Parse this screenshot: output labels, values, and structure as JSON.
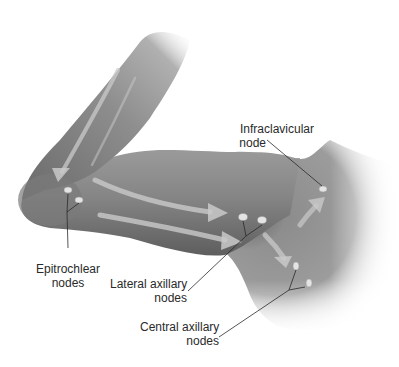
{
  "figure": {
    "type": "anatomical-illustration",
    "colors": {
      "background": "#ffffff",
      "skin_dark": "#6e6e6e",
      "skin_mid": "#8c8c8c",
      "skin_light": "#b4b4b4",
      "arrow": "#c8c8c8",
      "node": "#e2e2e2",
      "leader_line": "#2a2a2a",
      "label_text": "#2a2a2a"
    }
  },
  "labels": {
    "infraclavicular": {
      "line1": "Infraclavicular",
      "line2": "node"
    },
    "epitrochlear": {
      "line1": "Epitrochlear",
      "line2": "nodes"
    },
    "lateral_axillary": {
      "line1": "Lateral axillary",
      "line2": "nodes"
    },
    "central_axillary": {
      "line1": "Central axillary",
      "line2": "nodes"
    }
  },
  "nodes": [
    {
      "name": "epitrochlear-node-1",
      "x": 68,
      "y": 190
    },
    {
      "name": "epitrochlear-node-2",
      "x": 79,
      "y": 200
    },
    {
      "name": "lateral-axillary-node-1",
      "x": 243,
      "y": 217
    },
    {
      "name": "lateral-axillary-node-2",
      "x": 262,
      "y": 222
    },
    {
      "name": "central-axillary-node-1",
      "x": 296,
      "y": 267
    },
    {
      "name": "central-axillary-node-2",
      "x": 309,
      "y": 283
    },
    {
      "name": "infraclavicular-node",
      "x": 323,
      "y": 189
    }
  ]
}
